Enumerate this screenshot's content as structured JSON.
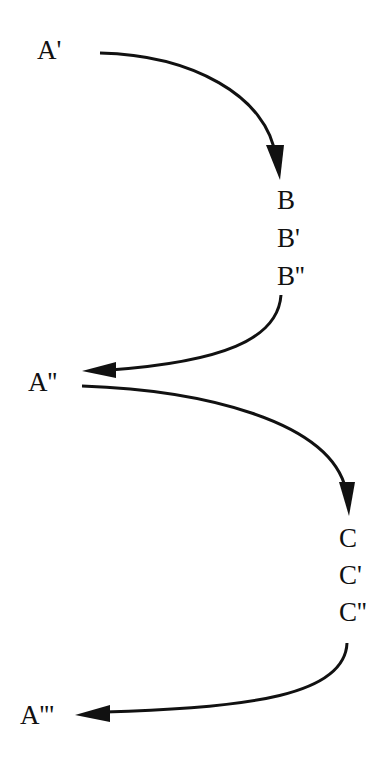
{
  "diagram": {
    "nodes": {
      "a1": "A'",
      "b": "B",
      "b1": "B'",
      "b2": "B''",
      "a2": "A''",
      "c": "C",
      "c1": "C'",
      "c2": "C''",
      "a3": "A'''"
    },
    "edges": [
      {
        "from": "A'",
        "to": "B",
        "direction": "down-right"
      },
      {
        "from": "B''",
        "to": "A''",
        "direction": "down-left"
      },
      {
        "from": "A''",
        "to": "C",
        "direction": "down-right"
      },
      {
        "from": "C''",
        "to": "A'''",
        "direction": "down-left"
      }
    ],
    "colors": {
      "ink": "#111111",
      "background": "#ffffff"
    }
  }
}
